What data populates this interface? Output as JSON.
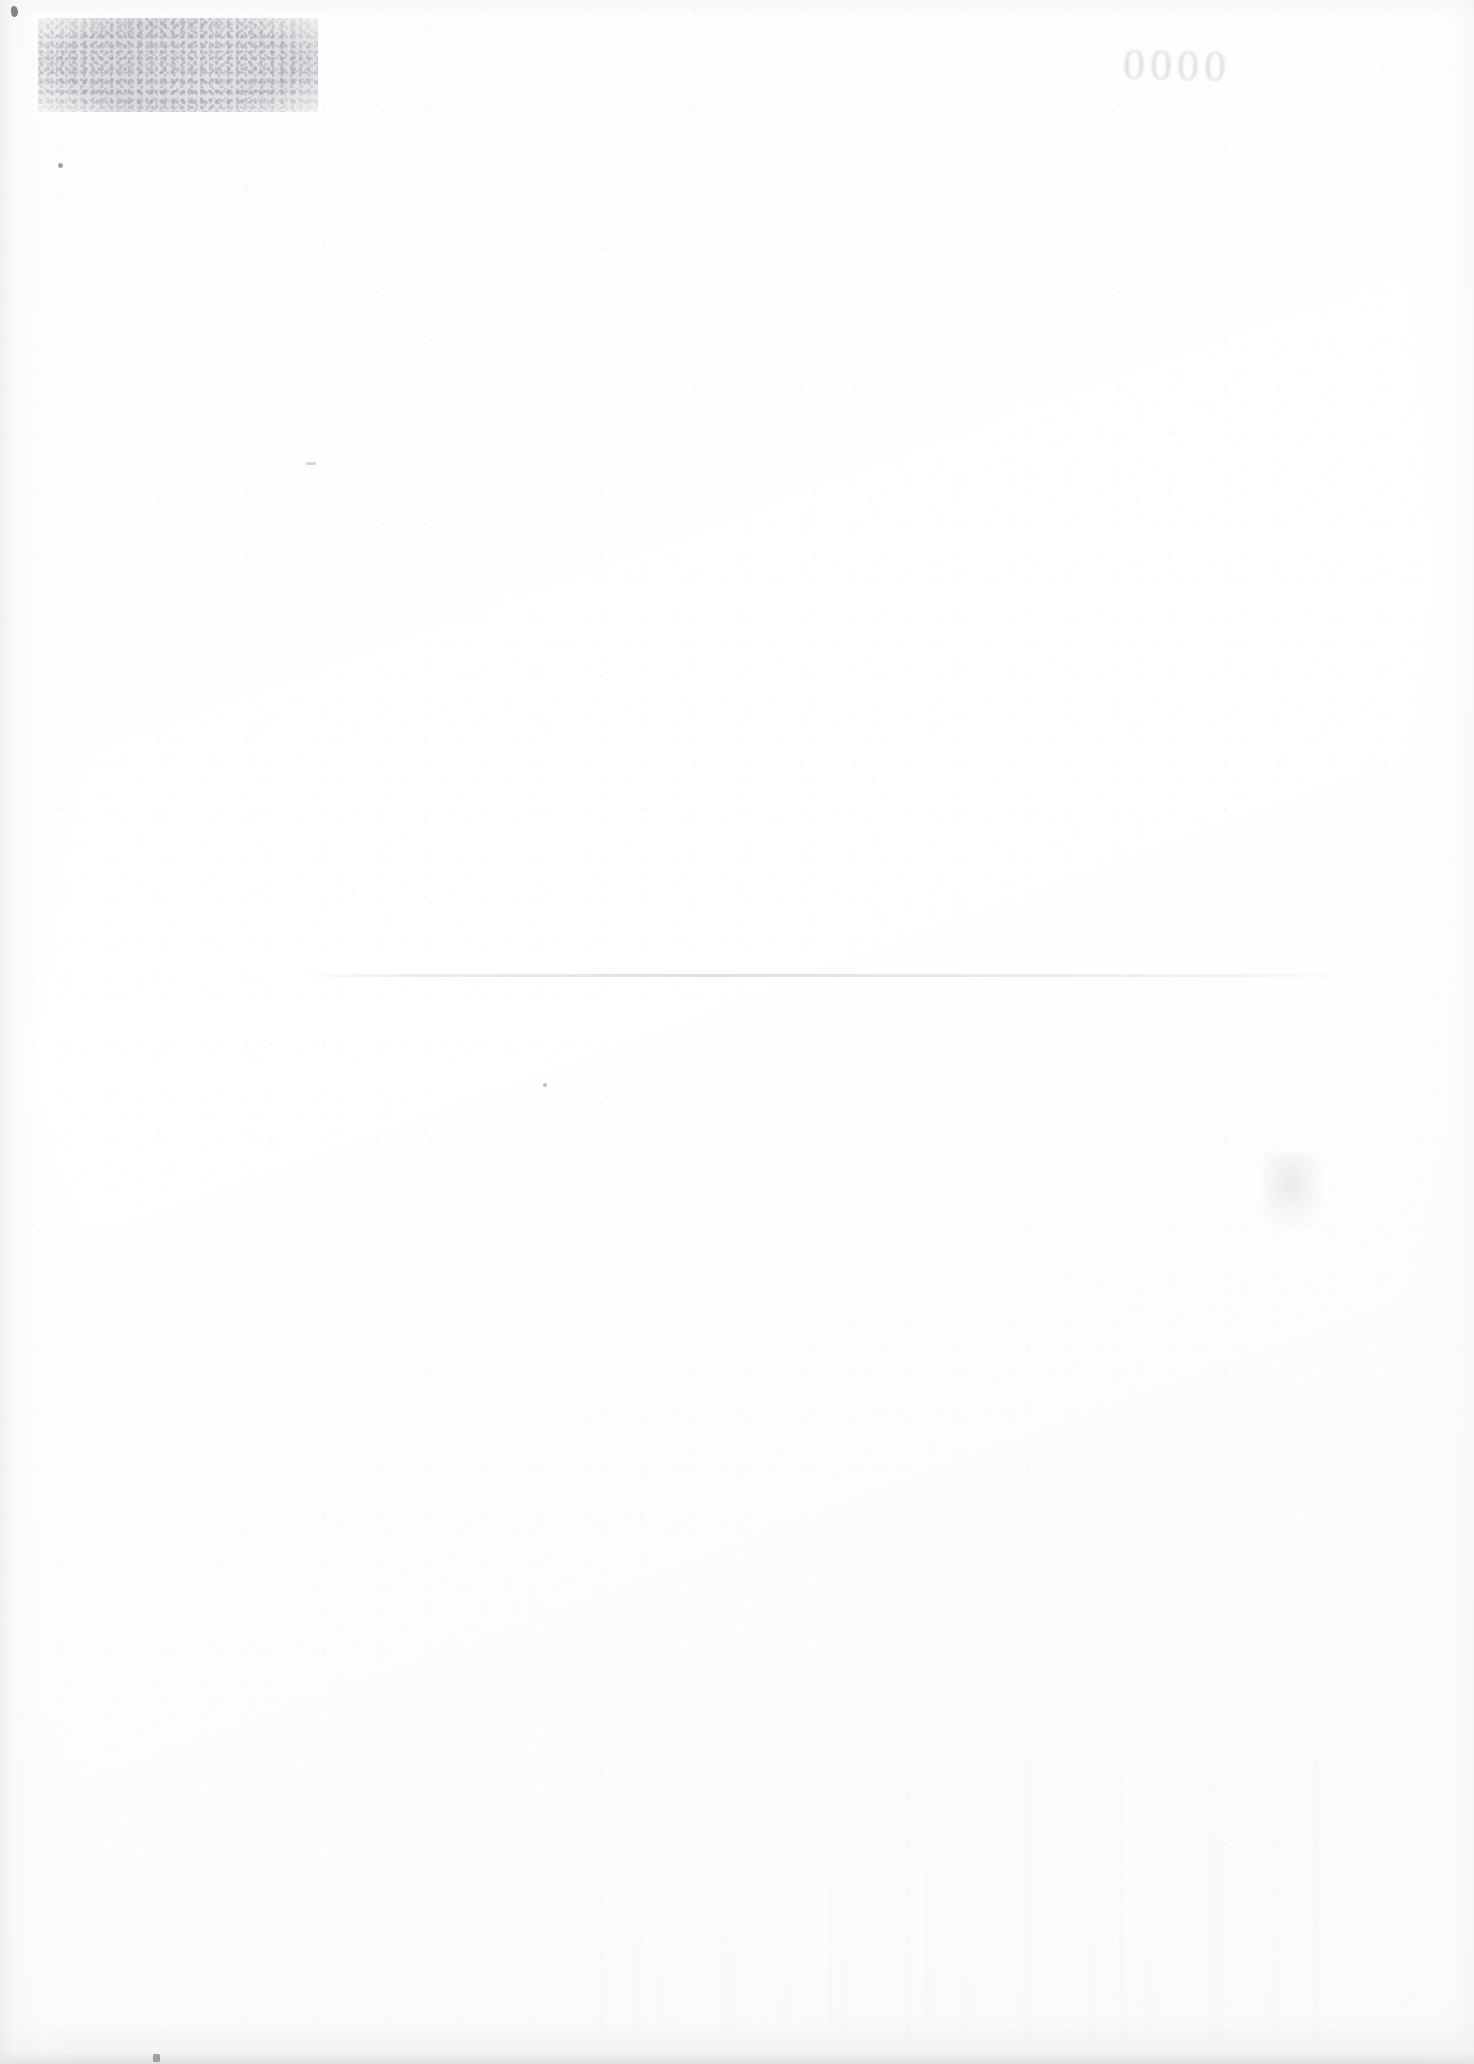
{
  "document": {
    "type": "scanned-page",
    "title": "Blank scanned document page",
    "orientation": "portrait",
    "width_px": 1474,
    "height_px": 2064,
    "body_text": "",
    "description": "A near-blank scanned sheet of paper. No printed body text is legible. Visible features are scan artifacts: a grainy rectangular ink stamp or redaction smudge in the upper-left, a faint mirrored bleed-through numeral mark in the upper-right, a horizontal fold crease across the middle, soft edge shading, and scattered dust specks."
  },
  "colors": {
    "paper": "#fdfdfe",
    "paper_highlight": "#ffffff",
    "paper_shadow": "#f4f5f6",
    "edge_shadow": "#d0d3d6",
    "smudge_gray": "#b6b9be",
    "smudge_dark": "#8a8d92",
    "crease_gray": "#d0d4d8",
    "speck_dark": "#54565a",
    "bleed_text": "#b0b4ba"
  },
  "artifacts": {
    "stamp_smudge": {
      "name": "ink-stamp-smudge",
      "label": "",
      "position": {
        "left_px": 38,
        "top_px": 18,
        "width_px": 280,
        "height_px": 94
      },
      "appearance": "grainy mottled gray rectangle, feathered edges"
    },
    "bleed_through": {
      "name": "bleed-through-mark",
      "text": "0000",
      "legible": false,
      "position": {
        "left_px": 1036,
        "top_px": 36,
        "width_px": 190,
        "height_px": 60
      },
      "appearance": "faint mirrored numerals showing through from reverse side"
    },
    "crease": {
      "name": "fold-crease",
      "label": "",
      "position": {
        "left_px": 300,
        "top_px": 974,
        "width_px": 1060,
        "height_px": 3
      },
      "appearance": "faint horizontal fold line"
    },
    "faint_smudge_right": {
      "name": "faint-show-through-smudge",
      "label": "",
      "position": {
        "left_px": 1262,
        "top_px": 1152,
        "width_px": 62,
        "height_px": 78
      }
    },
    "specks": [
      {
        "name": "speck-top-left-corner",
        "left_px": 11,
        "top_px": 6
      },
      {
        "name": "speck-top-left-lower",
        "left_px": 58,
        "top_px": 163
      },
      {
        "name": "speck-center",
        "left_px": 543,
        "top_px": 1083
      },
      {
        "name": "speck-bottom-left",
        "left_px": 153,
        "top_px": 2054
      },
      {
        "name": "speck-upper-middle",
        "left_px": 306,
        "top_px": 462
      }
    ]
  }
}
